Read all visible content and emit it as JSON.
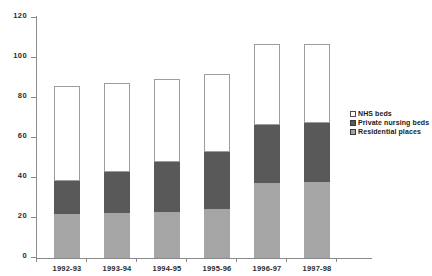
{
  "chart_data": {
    "type": "bar",
    "subtype": "stacked-bar",
    "title": "",
    "subtitle": "",
    "xlabel": "",
    "ylabel": "",
    "categories": [
      "1992-93",
      "1993-94",
      "1994-95",
      "1995-96",
      "1996-97",
      "1997-98"
    ],
    "series": [
      {
        "name": "Residential places",
        "color": "#a5a5a5",
        "values": [
          22,
          22.5,
          23,
          24.5,
          37.5,
          38
        ]
      },
      {
        "name": "Private nursing beds",
        "color": "#595959",
        "values": [
          16.5,
          20.5,
          25,
          28.5,
          29,
          29.5
        ]
      },
      {
        "name": "NHS beds",
        "color": "#ffffff",
        "values": [
          47.5,
          44.5,
          41.5,
          39,
          40.5,
          39.5
        ]
      }
    ],
    "stack_order_bottom_to_top": [
      "Residential places",
      "Private nursing beds",
      "NHS beds"
    ],
    "cumulative_tops": [
      86,
      87.5,
      89.5,
      92,
      107,
      107
    ],
    "totals": [
      86,
      87.5,
      89.5,
      92,
      107,
      107
    ],
    "ylim": [
      0,
      120
    ],
    "yticks": [
      0,
      20,
      40,
      60,
      80,
      100,
      120
    ],
    "ytick_labels": [
      "0",
      "20",
      "40",
      "60",
      "80",
      "100",
      "120"
    ],
    "grid": false,
    "legend_position": "right"
  },
  "legend": {
    "items": [
      {
        "label": "NHS beds",
        "swatch": "white-square-swatch"
      },
      {
        "label": "Private nursing beds",
        "swatch": "dark-gray-square-swatch"
      },
      {
        "label": "Residential places",
        "swatch": "medium-gray-square-swatch"
      }
    ]
  },
  "colors": {
    "nhs_beds": "#ffffff",
    "private_nursing_beds": "#595959",
    "residential_places": "#a5a5a5",
    "axis": "#8a8a8a",
    "text": "#1a1a1a",
    "background": "#ffffff"
  }
}
